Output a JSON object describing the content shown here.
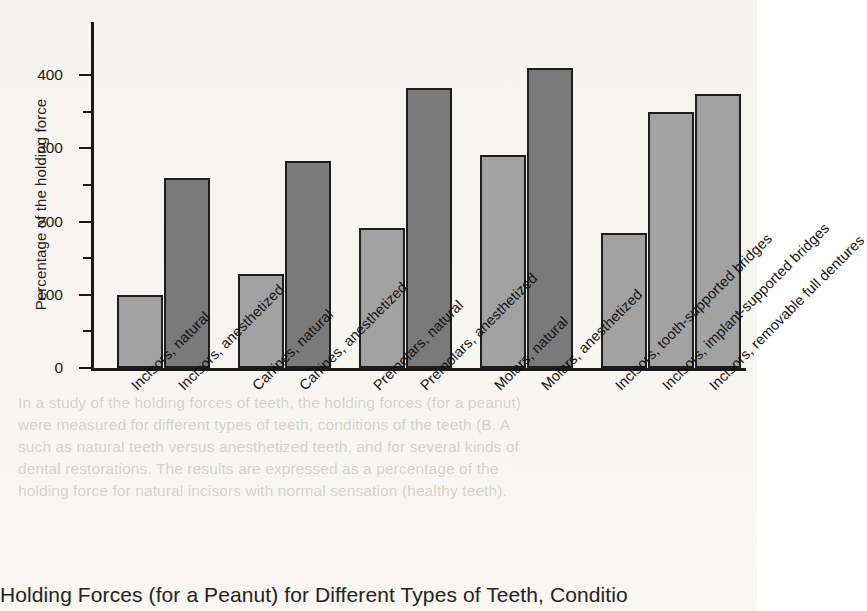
{
  "figure": {
    "caption": "Holding Forces (for a Peanut) for Different Types of Teeth, Conditio",
    "background_color": "#f6f4f0"
  },
  "ghost_text": "In a study of the holding forces of teeth, the holding forces (for a peanut)\nwere measured for different types of teeth, conditions of the teeth (B. A\nsuch as natural teeth versus anesthetized teeth, and for several kinds of\ndental restorations. The results are expressed as a percentage of the\nholding force for natural incisors with normal sensation (healthy teeth).",
  "chart_data": {
    "type": "bar",
    "title": "Holding Forces (for a Peanut) for Different Types of Teeth, Conditio",
    "xlabel": "",
    "ylabel": "Percentage of the holding force",
    "ylim": [
      0,
      440
    ],
    "y_major_ticks": [
      0,
      100,
      200,
      300,
      400
    ],
    "y_minor_ticks": [
      50,
      150,
      250,
      350
    ],
    "y_tick_labels": [
      "0",
      "100",
      "200",
      "300",
      "400"
    ],
    "grid": false,
    "legend": null,
    "categories": [
      "Incisors, natural",
      "Incisors, anesthetized",
      "Canines, natural",
      "Canines, anesthetized",
      "Premolars, natural",
      "Premolars, anesthetized",
      "Molars, natural",
      "Molars, anesthetized",
      "Incisors, tooth-supported bridges",
      "Incisors, implant-supported bridges",
      "Incisors, removable full dentures"
    ],
    "values": [
      100,
      259,
      129,
      283,
      192,
      383,
      291,
      410,
      185,
      350,
      375
    ],
    "bar_colors": [
      "#a2a2a2",
      "#7a7a7a",
      "#a2a2a2",
      "#7a7a7a",
      "#a2a2a2",
      "#7a7a7a",
      "#a2a2a2",
      "#7a7a7a",
      "#a2a2a2",
      "#a2a2a2",
      "#a2a2a2"
    ],
    "color_light": "#a2a2a2",
    "color_dark": "#7a7a7a",
    "bar_edge_color": "#1d1d1d",
    "groups": [
      {
        "name": "Incisors",
        "members": [
          "natural",
          "anesthetized"
        ]
      },
      {
        "name": "Canines",
        "members": [
          "natural",
          "anesthetized"
        ]
      },
      {
        "name": "Premolars",
        "members": [
          "natural",
          "anesthetized"
        ]
      },
      {
        "name": "Molars",
        "members": [
          "natural",
          "anesthetized"
        ]
      },
      {
        "name": "Restorations",
        "members": [
          "tooth-supported bridges",
          "implant-supported bridges",
          "removable full dentures"
        ]
      }
    ]
  }
}
